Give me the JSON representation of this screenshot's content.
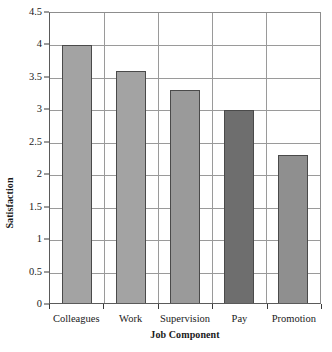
{
  "chart_data": {
    "type": "bar",
    "title": "",
    "subtitle": "",
    "categories": [
      "Colleagues",
      "Work",
      "Supervision",
      "Pay",
      "Promotion"
    ],
    "values": [
      4,
      3.6,
      3.3,
      3,
      2.3
    ],
    "xlabel": "Job Component",
    "ylabel": "Satisfaction",
    "ylim": [
      0,
      4.5
    ],
    "ytick_step": 0.5,
    "ytick_labels": [
      "0",
      "0.5",
      "1",
      "1.5",
      "2",
      "2.5",
      "3",
      "3.5",
      "4",
      "4.5"
    ],
    "ytick_values": [
      0,
      0.5,
      1,
      1.5,
      2,
      2.5,
      3,
      3.5,
      4,
      4.5
    ],
    "grid": {
      "horizontal": true,
      "vertical": true,
      "color": "#9a9a9a"
    },
    "legend": {
      "visible": false,
      "position": "none",
      "entries": []
    },
    "bar_colors": [
      "#a3a3a3",
      "#a3a3a3",
      "#9a9a9a",
      "#6e6e6e",
      "#8f8f8f"
    ],
    "bar_border_color": "#4a4a4a",
    "plot_border_color": "#5a5a5a",
    "background_color": "#ffffff",
    "annotations": []
  }
}
